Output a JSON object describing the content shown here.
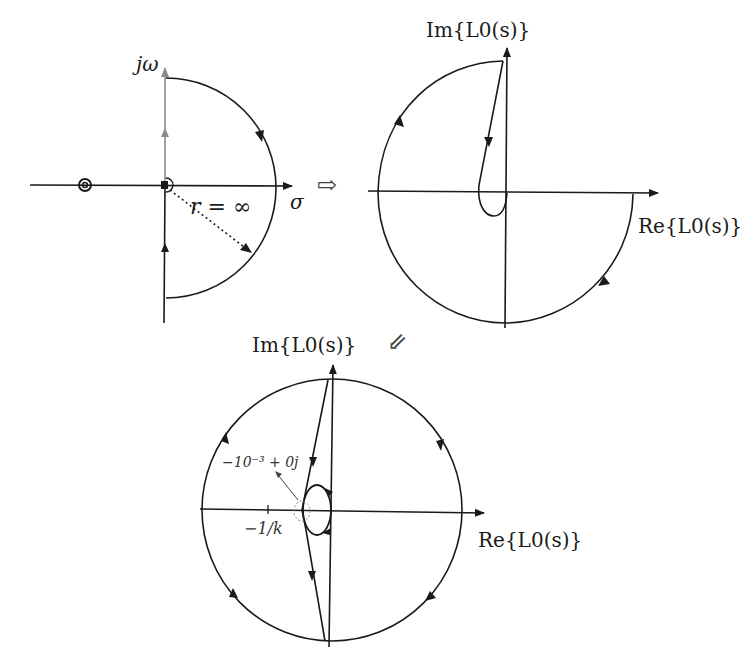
{
  "panels": {
    "s_plane": {
      "title": "Nyquist contour in s-plane",
      "vertical_axis_label": "jω",
      "horizontal_axis_label": "σ",
      "radius_label": "r = ∞",
      "markers": [
        "double pole on negative real axis",
        "pole at origin with indentation"
      ]
    },
    "nyquist_plot_1": {
      "vertical_axis_label": "Im{L0(s)}",
      "horizontal_axis_label": "Re{L0(s)}"
    },
    "nyquist_plot_2": {
      "vertical_axis_label": "Im{L0(s)}",
      "horizontal_axis_label": "Re{L0(s)}",
      "tick_label": "−1/k",
      "annotation": "−10⁻³ + 0j"
    }
  },
  "arrows": {
    "right": "⇨",
    "down_left": "⇙"
  },
  "colors": {
    "stroke": "#1a1a1a",
    "grey_axis": "#8a8a8a",
    "background": "#ffffff"
  }
}
